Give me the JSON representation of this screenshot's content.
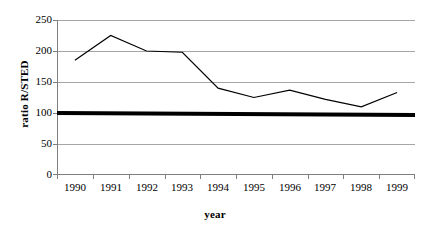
{
  "chart_data": {
    "type": "line",
    "title": "",
    "xlabel": "year",
    "ylabel": "ratio R/STED",
    "categories": [
      "1990",
      "1991",
      "1992",
      "1993",
      "1994",
      "1995",
      "1996",
      "1997",
      "1998",
      "1999"
    ],
    "series": [
      {
        "name": "ratio R/STED",
        "values": [
          185,
          225,
          200,
          198,
          140,
          125,
          137,
          122,
          110,
          133
        ],
        "style": "thin-line",
        "color": "#000000"
      },
      {
        "name": "reference level",
        "values": [
          100,
          100,
          100,
          100,
          100,
          100,
          100,
          100,
          100,
          100
        ],
        "style": "thick-line",
        "color": "#000000"
      }
    ],
    "ylim": [
      0,
      250
    ],
    "yticks": [
      0,
      50,
      100,
      150,
      200,
      250
    ],
    "ytick_labels": [
      "0",
      "50",
      "100",
      "150",
      "200",
      "250"
    ],
    "grid": "horizontal",
    "legend": "none",
    "colors": {
      "gridline": "#a6a6a6",
      "axis": "#7f7f7f",
      "plot_background": "#ffffff",
      "series_line": "#000000"
    }
  }
}
